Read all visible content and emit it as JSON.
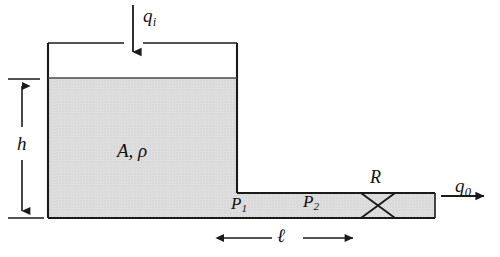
{
  "figure": {
    "background_color": "#ffffff",
    "line_color": "#1a1a1a",
    "fill_color": "#dcdcdc"
  },
  "labels": {
    "inflow": {
      "symbol": "q",
      "subscript": "i",
      "text": "q"
    },
    "outflow": {
      "symbol": "q",
      "subscript": "0",
      "text": "q"
    },
    "height": {
      "text": "h"
    },
    "tank_props": {
      "text": "A, ρ"
    },
    "pressure_1": {
      "symbol": "P",
      "subscript": "1",
      "text": "P"
    },
    "pressure_2": {
      "symbol": "P",
      "subscript": "2",
      "text": "P"
    },
    "resistance": {
      "text": "R"
    },
    "pipe_length": {
      "text": "ℓ"
    }
  },
  "geometry": {
    "tank": {
      "left": 48,
      "right": 237,
      "top": 43,
      "bottom": 218,
      "liquid_surface": 78
    },
    "pipe": {
      "left": 48,
      "right": 435,
      "top": 193,
      "bottom": 218
    },
    "valve": {
      "center_x": 378,
      "half_width": 17
    },
    "inflow_arrow": {
      "x": 133,
      "y_start": 5,
      "y_end": 60
    },
    "outflow_arrow": {
      "y": 196,
      "x_start": 441,
      "x_end": 492
    },
    "height_dim": {
      "x": 22,
      "y_top": 79,
      "y_bottom": 218
    },
    "length_dim": {
      "y": 238,
      "x_left": 222,
      "x_right": 356
    }
  }
}
